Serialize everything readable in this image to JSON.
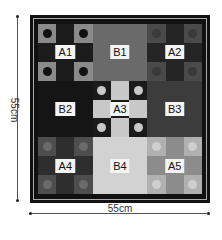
{
  "dimensions": {
    "height_label": "55cm",
    "width_label": "55cm"
  },
  "blocks": [
    {
      "id": "A1",
      "label": "A1",
      "type": "nine-patch",
      "dark": "#1c1c1c",
      "light": "#8a8a8a",
      "dot": "#111"
    },
    {
      "id": "B1",
      "label": "B1",
      "type": "solid",
      "color": "#6a6a6a"
    },
    {
      "id": "A2",
      "label": "A2",
      "type": "nine-patch",
      "dark": "#252525",
      "light": "#4a4a4a",
      "dot": "#3a3a3a"
    },
    {
      "id": "B2",
      "label": "B2",
      "type": "solid",
      "color": "#151515"
    },
    {
      "id": "A3",
      "label": "A3",
      "type": "nine-patch-inv",
      "dark": "#1a1a1a",
      "light": "#c8c8c8",
      "dot": "#c8c8c8"
    },
    {
      "id": "B3",
      "label": "B3",
      "type": "solid",
      "color": "#3c3c3c"
    },
    {
      "id": "A4",
      "label": "A4",
      "type": "nine-patch",
      "dark": "#2e2e2e",
      "light": "#4e4e4e",
      "dot": "#6a6a6a"
    },
    {
      "id": "B4",
      "label": "B4",
      "type": "solid",
      "color": "#d2d2d2"
    },
    {
      "id": "A5",
      "label": "A5",
      "type": "nine-patch",
      "dark": "#8c8c8c",
      "light": "#b0b0b0",
      "dot": "#cfcfcf"
    }
  ]
}
